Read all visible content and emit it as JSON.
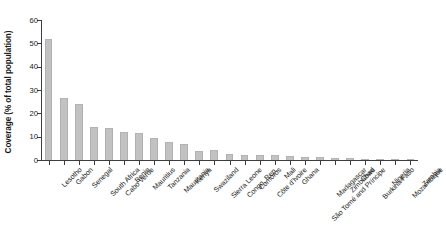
{
  "chart_data": {
    "type": "bar",
    "title": "",
    "subtitle": "",
    "xlabel": "",
    "ylabel": "Coverage (% of total population)",
    "ylim": [
      0,
      60
    ],
    "yticks": [
      0,
      10,
      20,
      30,
      40,
      50,
      60
    ],
    "ytick_labels": [
      "0",
      "10",
      "20",
      "30",
      "40",
      "50",
      "60"
    ],
    "grid": false,
    "legend": null,
    "bar_color": "#c2c2c2",
    "axis_color": "#3d3d3d",
    "categories": [
      "Lesotho",
      "Gabon",
      "Senegal",
      "South Africa",
      "Cabo Verde",
      "Benin",
      "Mauritius",
      "Tanzania",
      "Mauritania",
      "Kenya",
      "Swaziland",
      "Sierra Leone",
      "Congo, Rep.",
      "Comoros",
      "Côte d'Ivoire",
      "Mali",
      "Ghana",
      "São Tomé and Príncipe",
      "Madagascar",
      "Zimbabwe",
      "Chad",
      "Burkina Faso",
      "Nigeria",
      "Mozambique",
      "Zambia"
    ],
    "values": [
      51.8,
      26.6,
      23.9,
      14.3,
      13.7,
      11.9,
      11.4,
      9.6,
      7.7,
      6.9,
      4.0,
      4.3,
      2.6,
      2.3,
      2.2,
      2.0,
      1.7,
      1.5,
      1.3,
      1.0,
      0.8,
      0.5,
      0.4,
      0.3,
      0.2
    ]
  }
}
